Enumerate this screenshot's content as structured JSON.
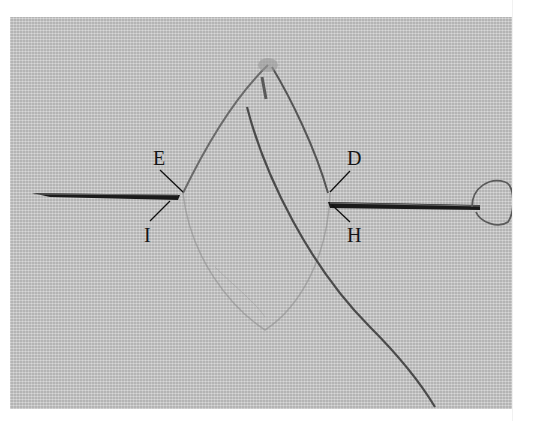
{
  "image": {
    "description": "Embroidery stitch diagram photo: needle passing through gray woven fabric with thread forming a pointed leaf/lens shape, labeled points",
    "background_color": "#c9c9c9",
    "thread_color": "#5a5a5a",
    "needle_color": "#1a1a1a"
  },
  "labels": {
    "E": "E",
    "I": "I",
    "D": "D",
    "H": "H"
  }
}
